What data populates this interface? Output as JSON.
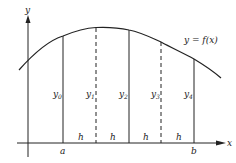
{
  "figure": {
    "function_label": "y = f(x)",
    "y_axis_label": "y",
    "x_axis_label": "x",
    "left_bound_label": "a",
    "right_bound_label": "b",
    "interval_label": "h",
    "ordinates": [
      {
        "name": "y",
        "sub": "0",
        "style": "solid"
      },
      {
        "name": "y",
        "sub": "1",
        "style": "dashed"
      },
      {
        "name": "y",
        "sub": "2",
        "style": "solid"
      },
      {
        "name": "y",
        "sub": "3",
        "style": "dashed"
      },
      {
        "name": "y",
        "sub": "4",
        "style": "solid"
      }
    ],
    "intervals": [
      "h",
      "h",
      "h",
      "h"
    ],
    "colors": {
      "line": "#222222",
      "background": "#ffffff"
    }
  }
}
